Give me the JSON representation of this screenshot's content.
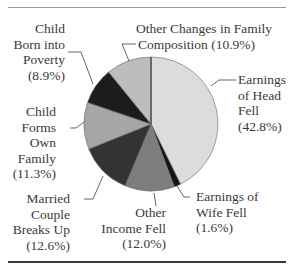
{
  "chart_data": {
    "type": "pie",
    "title": "",
    "start_angle": "12 o'clock",
    "direction": "clockwise",
    "categories": [
      "Earnings of Head Fell",
      "Earnings of Wife Fell",
      "Other Income Fell",
      "Married Couple Breaks Up",
      "Child Forms Own Family",
      "Child Born into Poverty",
      "Other Changes in Family Composition"
    ],
    "values": [
      42.8,
      1.6,
      12.0,
      12.6,
      11.3,
      8.9,
      10.9
    ],
    "unit": "%",
    "colors": [
      "#dcdcdc",
      "#151515",
      "#7d7d7d",
      "#333333",
      "#a6a6a6",
      "#1c1c1c",
      "#bdbdbd"
    ],
    "legend": "none (leader-line labels)"
  },
  "labels": {
    "head": {
      "lines": [
        "Earnings",
        "of Head",
        "Fell",
        "(42.8%)"
      ]
    },
    "wife": {
      "lines": [
        "Earnings of",
        "Wife Fell",
        "(1.6%)"
      ]
    },
    "other_income": {
      "lines": [
        "Other",
        "Income Fell",
        "(12.0%)"
      ]
    },
    "married": {
      "lines": [
        "Married",
        "Couple",
        "Breaks Up",
        "(12.6%)"
      ]
    },
    "child_forms": {
      "lines": [
        "Child",
        "Forms",
        "Own",
        "Family",
        "(11.3%)"
      ]
    },
    "child_born": {
      "lines": [
        "Child",
        "Born into",
        "Poverty",
        "(8.9%)"
      ]
    },
    "other_changes": {
      "lines": [
        "Other Changes in Family",
        "Composition (10.9%)"
      ]
    }
  }
}
